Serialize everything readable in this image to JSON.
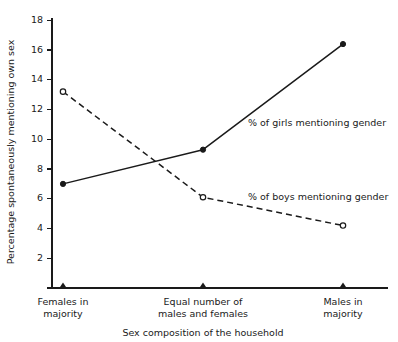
{
  "chart_data": {
    "type": "line",
    "title": "",
    "xlabel": "Sex composition of the household",
    "ylabel": "Percentage spontaneously mentioning own sex",
    "categories": [
      "Females in majority",
      "Equal number of males and females",
      "Males in majority"
    ],
    "category_lines": [
      [
        "Females in",
        "majority"
      ],
      [
        "Equal number of",
        "males and females"
      ],
      [
        "Males in",
        "majority"
      ]
    ],
    "series": [
      {
        "name": "% of girls mentioning gender",
        "values": [
          7.0,
          9.3,
          16.4
        ],
        "line_style": "solid",
        "marker": "filled-circle",
        "color": "#1a1a1a"
      },
      {
        "name": "% of boys mentioning gender",
        "values": [
          13.2,
          6.1,
          4.2
        ],
        "line_style": "dashed",
        "marker": "open-circle",
        "color": "#1a1a1a"
      }
    ],
    "ylim": [
      0,
      18.8
    ],
    "yticks": [
      2,
      4,
      6,
      8,
      10,
      12,
      14,
      16,
      18
    ],
    "ytick_labels": [
      "2",
      "4",
      "6",
      "8",
      "10",
      "12",
      "14",
      "16",
      "18"
    ],
    "grid": false,
    "legend_position": "inline-annotations",
    "annotations": [
      {
        "text": "% of girls mentioning gender",
        "x_px": 248,
        "y_px": 126
      },
      {
        "text": "% of boys mentioning gender",
        "x_px": 248,
        "y_px": 200
      }
    ],
    "xtick_marker": "triangle",
    "background_color": "#ffffff",
    "axis_color": "#1a1a1a"
  }
}
